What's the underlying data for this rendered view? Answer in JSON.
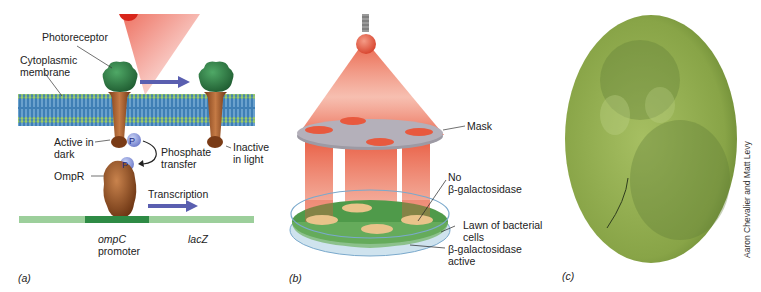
{
  "panel_a": {
    "panel_label": "(a)",
    "labels": {
      "photoreceptor": "Photoreceptor",
      "membrane_line1": "Cytoplasmic",
      "membrane_line2": "membrane",
      "active_line1": "Active in",
      "active_line2": "dark",
      "inactive_line1": "Inactive",
      "inactive_line2": "in light",
      "phosphate_line1": "Phosphate",
      "phosphate_line2": "transfer",
      "ompr": "OmpR",
      "transcription": "Transcription",
      "promoter_gene": "ompC",
      "promoter_word": "promoter",
      "reporter_gene": "lacZ",
      "phospho_symbol": "P"
    },
    "colors": {
      "light": "#e8432e",
      "membrane": "#3d7fb0",
      "protein_head": "#2f7a44",
      "protein_stalk": "#a0522d",
      "arrow": "#5a5fb0",
      "dna_light": "#8fcc90",
      "dna_dark": "#2e8b45"
    }
  },
  "panel_b": {
    "panel_label": "(b)",
    "labels": {
      "mask": "Mask",
      "no_line1": "No",
      "no_line2": "β-galactosidase",
      "lawn_line1": "Lawn of bacterial",
      "lawn_line2": "cells",
      "active_line1": "β-galactosidase",
      "active_line2": "active"
    },
    "colors": {
      "beam": "#e8593e",
      "mask": "#a8a4ad",
      "agar": "#4f9a4a",
      "spot": "#e9c38a"
    }
  },
  "panel_c": {
    "panel_label": "(c)",
    "credit": "Aaron Chevalier and Matt Levy",
    "colors": {
      "plate": "#95b24f",
      "dark": "#5e7a36"
    }
  }
}
